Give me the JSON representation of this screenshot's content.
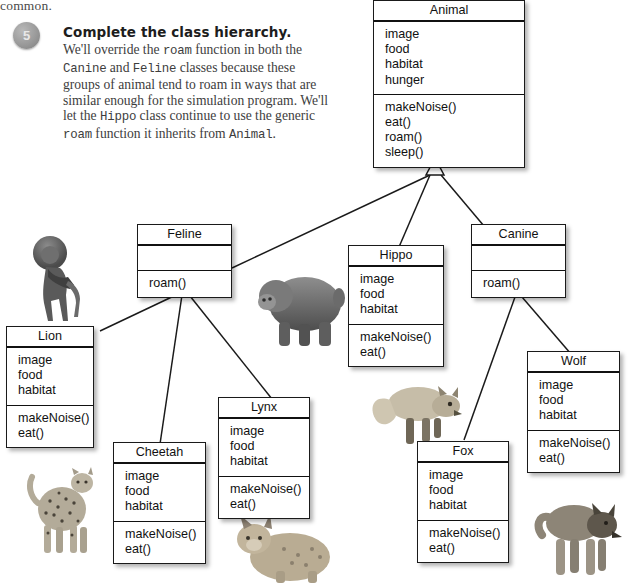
{
  "page": {
    "runover_text": "common.",
    "step_number": "5",
    "step_title": "Complete the class hierarchy.",
    "paragraph_parts": [
      {
        "t": "We'll override the ",
        "code": false
      },
      {
        "t": "roam",
        "code": true
      },
      {
        "t": " function in both the ",
        "code": false
      },
      {
        "t": "Canine",
        "code": true
      },
      {
        "t": " and ",
        "code": false
      },
      {
        "t": "Feline",
        "code": true
      },
      {
        "t": " classes because these groups of animal tend to roam in ways that are similar enough for the simulation program. We'll let the ",
        "code": false
      },
      {
        "t": "Hippo",
        "code": true
      },
      {
        "t": " class continue to use the generic ",
        "code": false
      },
      {
        "t": "roam",
        "code": true
      },
      {
        "t": " function it inherits from ",
        "code": false
      },
      {
        "t": "Animal",
        "code": true
      },
      {
        "t": ".",
        "code": false
      }
    ]
  },
  "diagram": {
    "type": "uml-class-hierarchy",
    "relationship": "generalization",
    "classes": [
      {
        "id": "animal",
        "name": "Animal",
        "attributes": [
          "image",
          "food",
          "habitat",
          "hunger"
        ],
        "operations": [
          "makeNoise()",
          "eat()",
          "roam()",
          "sleep()"
        ],
        "parent": null
      },
      {
        "id": "feline",
        "name": "Feline",
        "attributes": [],
        "operations": [
          "roam()"
        ],
        "parent": "animal"
      },
      {
        "id": "hippo",
        "name": "Hippo",
        "attributes": [
          "image",
          "food",
          "habitat"
        ],
        "operations": [
          "makeNoise()",
          "eat()"
        ],
        "parent": "animal"
      },
      {
        "id": "canine",
        "name": "Canine",
        "attributes": [],
        "operations": [
          "roam()"
        ],
        "parent": "animal"
      },
      {
        "id": "lion",
        "name": "Lion",
        "attributes": [
          "image",
          "food",
          "habitat"
        ],
        "operations": [
          "makeNoise()",
          "eat()"
        ],
        "parent": "feline"
      },
      {
        "id": "cheetah",
        "name": "Cheetah",
        "attributes": [
          "image",
          "food",
          "habitat"
        ],
        "operations": [
          "makeNoise()",
          "eat()"
        ],
        "parent": "feline"
      },
      {
        "id": "lynx",
        "name": "Lynx",
        "attributes": [
          "image",
          "food",
          "habitat"
        ],
        "operations": [
          "makeNoise()",
          "eat()"
        ],
        "parent": "feline"
      },
      {
        "id": "fox",
        "name": "Fox",
        "attributes": [
          "image",
          "food",
          "habitat"
        ],
        "operations": [
          "makeNoise()",
          "eat()"
        ],
        "parent": "canine"
      },
      {
        "id": "wolf",
        "name": "Wolf",
        "attributes": [
          "image",
          "food",
          "habitat"
        ],
        "operations": [
          "makeNoise()",
          "eat()"
        ],
        "parent": "canine"
      }
    ],
    "photos": [
      {
        "id": "lion-photo",
        "label": "lion"
      },
      {
        "id": "hippo-photo",
        "label": "hippo"
      },
      {
        "id": "cheetah-photo",
        "label": "cheetah"
      },
      {
        "id": "lynx-photo",
        "label": "lynx"
      },
      {
        "id": "fox-photo",
        "label": "fox"
      },
      {
        "id": "wolf-photo",
        "label": "wolf"
      }
    ]
  },
  "colors": {
    "box_border": "#1a1a1a",
    "text": "#111111",
    "paper": "#ffffff",
    "body_text": "#3d3d3d",
    "bullet": "#9a9a9a"
  }
}
